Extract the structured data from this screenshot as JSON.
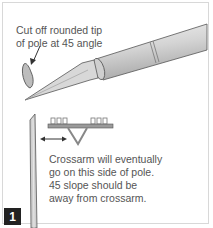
{
  "diagram": {
    "step_number": "1",
    "callout_top": [
      "Cut off rounded tip",
      "of pole at 45 angle"
    ],
    "callout_bottom": [
      "Crossarm will eventually",
      "go on this side of pole.",
      "45 slope should be",
      "away from crossarm."
    ]
  }
}
